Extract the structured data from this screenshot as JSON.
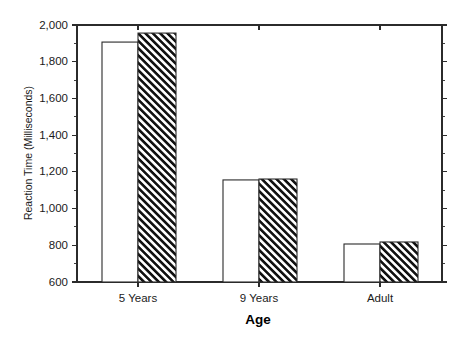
{
  "chart_data": {
    "type": "bar",
    "title": "",
    "xlabel": "Age",
    "ylabel": "Reaction Time (Milliseconds)",
    "categories": [
      "5 Years",
      "9 Years",
      "Adult"
    ],
    "series": [
      {
        "name": "open",
        "style": "white-open-bar",
        "values": [
          1907,
          1156,
          807
        ]
      },
      {
        "name": "hatched",
        "style": "black-diagonal-hatch-bar",
        "values": [
          1956,
          1161,
          818
        ]
      }
    ],
    "ylim": [
      600,
      2000
    ],
    "ytick_labels": [
      "600",
      "800",
      "1,000",
      "1,200",
      "1,400",
      "1,600",
      "1,800",
      "2,000"
    ],
    "ytick_values": [
      600,
      800,
      1000,
      1200,
      1400,
      1600,
      1800,
      2000
    ],
    "minor_tick_interval": 100,
    "grid": false,
    "legend": "none",
    "frame": "box",
    "tick_direction": "out",
    "colors": {
      "axis": "#2b2b2b",
      "bar_open_fill": "#ffffff",
      "bar_hatch_fill": "#000000",
      "background": "#ffffff",
      "text": "#1a1a1a"
    }
  }
}
